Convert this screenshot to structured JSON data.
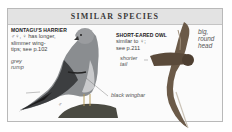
{
  "panel": {
    "title": "SIMILAR SPECIES"
  },
  "species": [
    {
      "name": "MONTAGU'S HARRIER",
      "lines": [
        "♂♀, ♀ has longer,",
        "slimmer wing-",
        "tips; see p.102"
      ]
    },
    {
      "name": "SHORT-EARED OWL",
      "lines": [
        "similar to ♀;",
        "see p.211"
      ]
    }
  ],
  "labels": {
    "grey_rump": [
      "grey",
      "rump"
    ],
    "black_wingbar": "black wingbar",
    "male_symbol": "♂",
    "shorter_tail": [
      "shorter",
      "tail"
    ],
    "big_round_head": [
      "big,",
      "round",
      "head"
    ]
  },
  "colors": {
    "panel_border": "#b9b9b9",
    "header_bg": "#e3e3e3",
    "bird_grey": "#8a8d90",
    "owl_brown": "#6b5a48"
  }
}
